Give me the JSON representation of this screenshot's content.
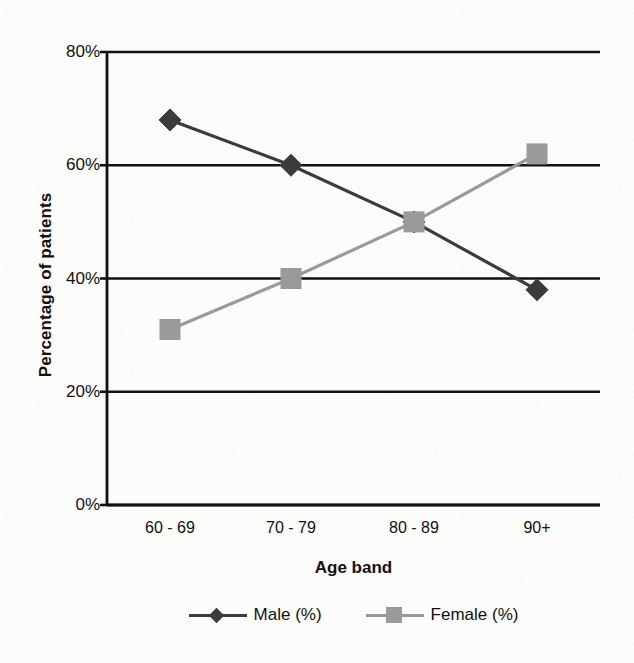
{
  "chart_data": {
    "type": "line",
    "title": "",
    "xlabel": "Age band",
    "ylabel": "Percentage of patients",
    "categories": [
      "60 - 69",
      "70 - 79",
      "80 - 89",
      "90+"
    ],
    "series": [
      {
        "name": "Male (%)",
        "values": [
          68,
          60,
          50,
          38
        ],
        "color": "#3b3b3b",
        "marker": "diamond"
      },
      {
        "name": "Female (%)",
        "values": [
          31,
          40,
          50,
          62
        ],
        "color": "#9a9a9a",
        "marker": "square"
      }
    ],
    "ylim": [
      0,
      80
    ],
    "y_ticks": [
      0,
      20,
      40,
      60,
      80
    ],
    "y_tick_labels": [
      "0%",
      "20%",
      "40%",
      "60%",
      "80%"
    ],
    "grid": "horizontal",
    "legend_position": "bottom"
  },
  "axes": {
    "y_title": "Percentage of patients",
    "x_title": "Age band"
  },
  "colors": {
    "male": "#3b3b3b",
    "female": "#9a9a9a",
    "axis": "#111111",
    "grid": "#111111",
    "background": "#fcfcfb"
  }
}
